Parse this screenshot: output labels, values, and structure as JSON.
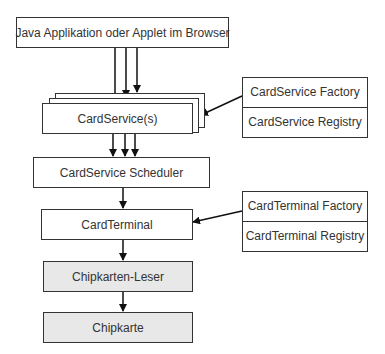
{
  "diagram": {
    "nodes": {
      "app": "Java Applikation oder Applet im  Browser",
      "cardservice": "CardService(s)",
      "scheduler": "CardService Scheduler",
      "cardterminal": "CardTerminal",
      "reader": "Chipkarten-Leser",
      "card": "Chipkarte"
    },
    "cardservice_side": {
      "factory": "CardService Factory",
      "registry": "CardService Registry"
    },
    "cardterminal_side": {
      "factory": "CardTerminal Factory",
      "registry": "CardTerminal Registry"
    },
    "edges": [
      {
        "from": "app",
        "to": "cardservice",
        "count": 3
      },
      {
        "from": "cardservice_side",
        "to": "cardservice",
        "count": 1
      },
      {
        "from": "cardservice",
        "to": "scheduler",
        "count": 3
      },
      {
        "from": "scheduler",
        "to": "cardterminal",
        "count": 1
      },
      {
        "from": "cardterminal_side",
        "to": "cardterminal",
        "count": 1
      },
      {
        "from": "cardterminal",
        "to": "reader",
        "count": 1
      },
      {
        "from": "reader",
        "to": "card",
        "count": 1
      }
    ]
  }
}
